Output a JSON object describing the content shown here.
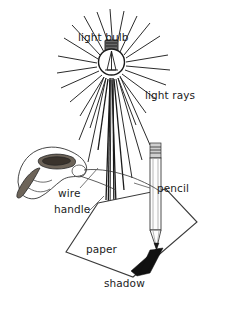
{
  "figure": {
    "kind": "line-drawing-diagram",
    "background_color": "#ffffff",
    "ink_color": "#1c1c1c"
  },
  "labels": {
    "light_bulb": "light bulb",
    "light_rays": "light rays",
    "wire": "wire",
    "handle": "handle",
    "pencil": "pencil",
    "paper": "paper",
    "shadow": "shadow"
  },
  "colors": {
    "ink": "#1c1c1c",
    "ray": "#2b2b2b",
    "shadow": "#111111",
    "bulb_base": "#6a6a6a",
    "handle": "#6d6459",
    "paper": "#ffffff"
  },
  "parts": {
    "bulb": {
      "name": "light-bulb",
      "center_x": 111,
      "center_y": 62,
      "radius": 13
    },
    "rays": {
      "name": "light-rays",
      "count": 34,
      "origin_x": 111,
      "origin_y": 62
    },
    "pencil": {
      "name": "pencil",
      "tip_x": 157,
      "tip_y": 248,
      "top_y": 143
    },
    "paper": {
      "name": "paper-sheet",
      "shape": "parallelogram"
    },
    "shadow": {
      "name": "shadow-wedge",
      "from": "pencil tip",
      "direction": "down-right"
    },
    "hand": {
      "name": "hand-holding-handle"
    }
  }
}
